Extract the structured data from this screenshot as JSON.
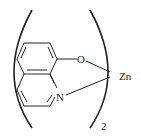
{
  "diagram": {
    "type": "chemical-structure",
    "atoms": {
      "oxygen": "O",
      "nitrogen": "N",
      "metal": "Zn"
    },
    "subscript": "2"
  }
}
